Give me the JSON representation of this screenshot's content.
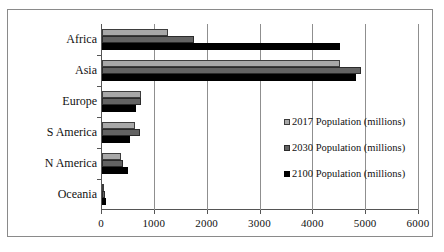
{
  "chart_data": {
    "type": "bar",
    "orientation": "horizontal",
    "title": "",
    "xlabel": "",
    "ylabel": "",
    "categories": [
      "Africa",
      "Asia",
      "Europe",
      "S America",
      "N America",
      "Oceania"
    ],
    "series": [
      {
        "name": "2017 Population (millions)",
        "color": "#a8a8a8",
        "values": [
          1250,
          4500,
          740,
          630,
          360,
          40
        ]
      },
      {
        "name": "2030 Population (millions)",
        "color": "#636363",
        "values": [
          1750,
          4900,
          730,
          720,
          400,
          50
        ]
      },
      {
        "name": "2100 Population (millions)",
        "color": "#000000",
        "values": [
          4500,
          4800,
          650,
          530,
          500,
          70
        ]
      }
    ],
    "xlim": [
      0,
      6000
    ],
    "xticks": [
      0,
      1000,
      2000,
      3000,
      4000,
      5000,
      6000
    ],
    "xticklabels": [
      "0",
      "1000",
      "2000",
      "3000",
      "4000",
      "5000",
      "6000"
    ],
    "grid": true,
    "grid_axis": "x",
    "legend_position": "inside-right"
  },
  "legend": {
    "entries": [
      {
        "label": "2017 Population (millions)",
        "swatch": "legend-swatch-2017"
      },
      {
        "label": "2030 Population (millions)",
        "swatch": "legend-swatch-2030"
      },
      {
        "label": "2100 Population (millions)",
        "swatch": "legend-swatch-2100"
      }
    ]
  }
}
